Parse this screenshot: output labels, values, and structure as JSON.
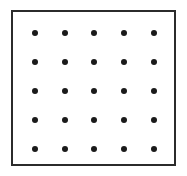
{
  "figure": {
    "caption": "",
    "background_color": "#ffffff"
  },
  "frame": {
    "name": "outer-square-border",
    "stroke_color": "#2b2b2b",
    "fill_color": "#ffffff",
    "stroke_width_px": 2,
    "x_px": 11,
    "y_px": 10,
    "width_px": 165,
    "height_px": 156
  },
  "dot_grid": {
    "rows": 5,
    "columns": 5,
    "total_dots": 25,
    "dot_color": "#1a1a1a",
    "dot_diameter_px": 6,
    "column_centers_px": [
      35,
      65,
      94,
      124,
      154
    ],
    "row_centers_px": [
      33,
      62,
      91,
      120,
      149
    ],
    "column_spacing_px": 30,
    "row_spacing_px": 29,
    "dots": [
      {
        "row": 1,
        "column": 1,
        "cx": 35,
        "cy": 33
      },
      {
        "row": 1,
        "column": 2,
        "cx": 65,
        "cy": 33
      },
      {
        "row": 1,
        "column": 3,
        "cx": 94,
        "cy": 33
      },
      {
        "row": 1,
        "column": 4,
        "cx": 124,
        "cy": 33
      },
      {
        "row": 1,
        "column": 5,
        "cx": 154,
        "cy": 33
      },
      {
        "row": 2,
        "column": 1,
        "cx": 35,
        "cy": 62
      },
      {
        "row": 2,
        "column": 2,
        "cx": 65,
        "cy": 62
      },
      {
        "row": 2,
        "column": 3,
        "cx": 94,
        "cy": 62
      },
      {
        "row": 2,
        "column": 4,
        "cx": 124,
        "cy": 62
      },
      {
        "row": 2,
        "column": 5,
        "cx": 154,
        "cy": 62
      },
      {
        "row": 3,
        "column": 1,
        "cx": 35,
        "cy": 91
      },
      {
        "row": 3,
        "column": 2,
        "cx": 65,
        "cy": 91
      },
      {
        "row": 3,
        "column": 3,
        "cx": 94,
        "cy": 91
      },
      {
        "row": 3,
        "column": 4,
        "cx": 124,
        "cy": 91
      },
      {
        "row": 3,
        "column": 5,
        "cx": 154,
        "cy": 91
      },
      {
        "row": 4,
        "column": 1,
        "cx": 35,
        "cy": 120
      },
      {
        "row": 4,
        "column": 2,
        "cx": 65,
        "cy": 120
      },
      {
        "row": 4,
        "column": 3,
        "cx": 94,
        "cy": 120
      },
      {
        "row": 4,
        "column": 4,
        "cx": 124,
        "cy": 120
      },
      {
        "row": 4,
        "column": 5,
        "cx": 154,
        "cy": 120
      },
      {
        "row": 5,
        "column": 1,
        "cx": 35,
        "cy": 149
      },
      {
        "row": 5,
        "column": 2,
        "cx": 65,
        "cy": 149
      },
      {
        "row": 5,
        "column": 3,
        "cx": 94,
        "cy": 149
      },
      {
        "row": 5,
        "column": 4,
        "cx": 124,
        "cy": 149
      },
      {
        "row": 5,
        "column": 5,
        "cx": 154,
        "cy": 149
      }
    ]
  }
}
